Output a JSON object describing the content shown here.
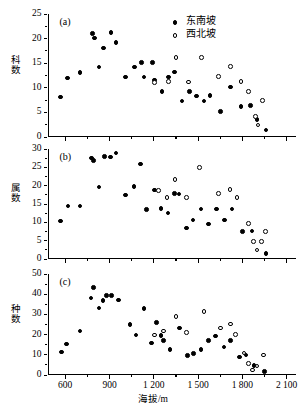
{
  "figure": {
    "xaxis_title": "海拔/m",
    "xticks": [
      "600",
      "900",
      "1 200",
      "1 500",
      "1 800",
      "2 100"
    ],
    "xtick_values": [
      600,
      900,
      1200,
      1500,
      1800,
      2100
    ],
    "xlim": [
      480,
      2160
    ],
    "legend": [
      {
        "label": "东南坡",
        "marker": "filled-circle",
        "key": "se"
      },
      {
        "label": "西北坡",
        "marker": "open-circle",
        "key": "nw"
      }
    ]
  },
  "chart_data": [
    {
      "type": "scatter",
      "panel": "a",
      "panel_label": "(a)",
      "title": "",
      "xlabel": "海拔/m",
      "ylabel": "科数",
      "xlim": [
        480,
        2160
      ],
      "ylim": [
        0,
        25
      ],
      "yticks": [
        0,
        5,
        10,
        15,
        20,
        25
      ],
      "ytick_labels": [
        "0",
        "5",
        "10",
        "15",
        "20",
        "25"
      ],
      "grid": false,
      "legend_position": "top-right",
      "series": [
        {
          "name": "东南坡",
          "marker": "filled-circle",
          "points": [
            [
              570,
              8.1
            ],
            [
              615,
              12.0
            ],
            [
              700,
              13.1
            ],
            [
              785,
              21.0
            ],
            [
              800,
              20.1
            ],
            [
              830,
              14.2
            ],
            [
              860,
              18.1
            ],
            [
              910,
              21.2
            ],
            [
              945,
              19.2
            ],
            [
              1010,
              12.2
            ],
            [
              1070,
              14.2
            ],
            [
              1115,
              15.1
            ],
            [
              1135,
              12.2
            ],
            [
              1190,
              15.2
            ],
            [
              1205,
              11.6
            ],
            [
              1255,
              9.2
            ],
            [
              1300,
              12.2
            ],
            [
              1340,
              13.2
            ],
            [
              1390,
              7.3
            ],
            [
              1440,
              9.3
            ],
            [
              1490,
              8.3
            ],
            [
              1540,
              7.3
            ],
            [
              1580,
              8.4
            ],
            [
              1650,
              5.2
            ],
            [
              1720,
              10.2
            ],
            [
              1790,
              6.2
            ],
            [
              1855,
              6.4
            ],
            [
              1900,
              3.6
            ],
            [
              1960,
              1.4
            ]
          ]
        },
        {
          "name": "西北坡",
          "marker": "open-circle",
          "points": [
            [
              1205,
              11.1
            ],
            [
              1300,
              11.3
            ],
            [
              1350,
              16.2
            ],
            [
              1435,
              11.2
            ],
            [
              1525,
              16.2
            ],
            [
              1640,
              12.3
            ],
            [
              1720,
              14.3
            ],
            [
              1790,
              11.3
            ],
            [
              1840,
              9.3
            ],
            [
              1890,
              4.2
            ],
            [
              1905,
              2.4
            ],
            [
              1935,
              7.4
            ]
          ]
        }
      ]
    },
    {
      "type": "scatter",
      "panel": "b",
      "panel_label": "(b)",
      "title": "",
      "xlabel": "海拔/m",
      "ylabel": "属数",
      "xlim": [
        480,
        2160
      ],
      "ylim": [
        0,
        30
      ],
      "yticks": [
        0,
        5,
        10,
        15,
        20,
        25,
        30
      ],
      "ytick_labels": [
        "0",
        "5",
        "10",
        "15",
        "20",
        "25",
        "30"
      ],
      "grid": false,
      "series": [
        {
          "name": "东南坡",
          "marker": "filled-circle",
          "points": [
            [
              570,
              10.4
            ],
            [
              620,
              14.4
            ],
            [
              700,
              14.5
            ],
            [
              780,
              27.6
            ],
            [
              790,
              26.9
            ],
            [
              830,
              19.6
            ],
            [
              865,
              27.9
            ],
            [
              905,
              27.8
            ],
            [
              945,
              28.9
            ],
            [
              1010,
              17.5
            ],
            [
              1065,
              19.7
            ],
            [
              1110,
              25.9
            ],
            [
              1150,
              13.5
            ],
            [
              1205,
              18.8
            ],
            [
              1250,
              13.7
            ],
            [
              1295,
              12.5
            ],
            [
              1340,
              17.8
            ],
            [
              1370,
              17.7
            ],
            [
              1420,
              8.5
            ],
            [
              1465,
              10.6
            ],
            [
              1520,
              13.6
            ],
            [
              1570,
              9.6
            ],
            [
              1625,
              13.6
            ],
            [
              1680,
              10.6
            ],
            [
              1730,
              13.6
            ],
            [
              1800,
              7.5
            ],
            [
              1865,
              7.6
            ],
            [
              1960,
              1.5
            ]
          ]
        },
        {
          "name": "西北坡",
          "marker": "open-circle",
          "points": [
            [
              1230,
              18.7
            ],
            [
              1290,
              16.8
            ],
            [
              1345,
              21.7
            ],
            [
              1420,
              16.7
            ],
            [
              1510,
              24.9
            ],
            [
              1640,
              17.8
            ],
            [
              1715,
              18.9
            ],
            [
              1765,
              16.8
            ],
            [
              1840,
              9.7
            ],
            [
              1875,
              4.7
            ],
            [
              1900,
              2.4
            ],
            [
              1930,
              4.7
            ],
            [
              1955,
              7.5
            ]
          ]
        }
      ]
    },
    {
      "type": "scatter",
      "panel": "c",
      "panel_label": "(c)",
      "title": "",
      "xlabel": "海拔/m",
      "ylabel": "种数",
      "xlim": [
        480,
        2160
      ],
      "ylim": [
        0,
        50
      ],
      "yticks": [
        0,
        10,
        20,
        30,
        40,
        50
      ],
      "ytick_labels": [
        "0",
        "10",
        "20",
        "30",
        "40",
        "50"
      ],
      "grid": false,
      "series": [
        {
          "name": "东南坡",
          "marker": "filled-circle",
          "points": [
            [
              575,
              11.3
            ],
            [
              610,
              15.4
            ],
            [
              700,
              21.7
            ],
            [
              775,
              38.2
            ],
            [
              790,
              43.2
            ],
            [
              830,
              33.1
            ],
            [
              855,
              36.8
            ],
            [
              880,
              39.5
            ],
            [
              915,
              39.5
            ],
            [
              960,
              37.2
            ],
            [
              1040,
              25.1
            ],
            [
              1080,
              19.9
            ],
            [
              1135,
              33.0
            ],
            [
              1185,
              15.9
            ],
            [
              1220,
              26.0
            ],
            [
              1250,
              19.6
            ],
            [
              1265,
              17.0
            ],
            [
              1310,
              12.7
            ],
            [
              1375,
              23.2
            ],
            [
              1430,
              9.7
            ],
            [
              1470,
              10.6
            ],
            [
              1520,
              12.6
            ],
            [
              1570,
              17.1
            ],
            [
              1620,
              19.4
            ],
            [
              1675,
              13.9
            ],
            [
              1720,
              17.1
            ],
            [
              1780,
              8.9
            ],
            [
              1825,
              9.9
            ],
            [
              1880,
              4.6
            ],
            [
              1950,
              1.6
            ]
          ]
        },
        {
          "name": "西北坡",
          "marker": "open-circle",
          "points": [
            [
              1205,
              19.9
            ],
            [
              1265,
              21.8
            ],
            [
              1350,
              29.0
            ],
            [
              1420,
              20.9
            ],
            [
              1540,
              31.3
            ],
            [
              1650,
              23.2
            ],
            [
              1720,
              25.2
            ],
            [
              1755,
              20.1
            ],
            [
              1810,
              10.8
            ],
            [
              1840,
              5.7
            ],
            [
              1870,
              2.5
            ],
            [
              1900,
              4.5
            ],
            [
              1945,
              9.9
            ]
          ]
        }
      ]
    }
  ]
}
